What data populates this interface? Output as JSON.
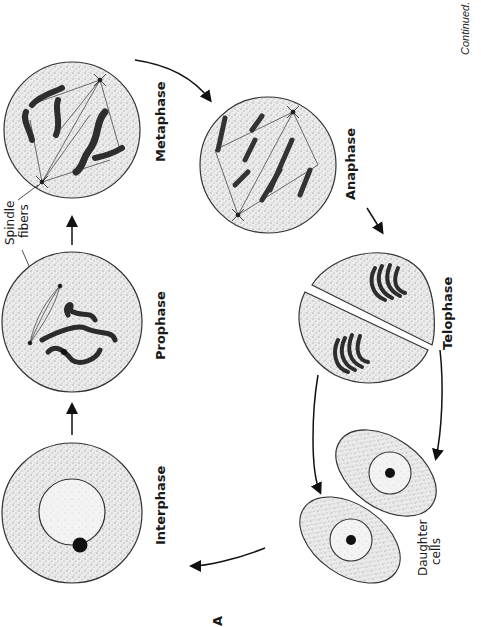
{
  "figure": {
    "panel_label": "A",
    "continued_note": "Continued.",
    "orientation": "rotated 90° counter-clockwise",
    "colors": {
      "cell_fill": "#e9e9e9",
      "outline": "#222222",
      "chromosome": "#3a3a3a",
      "stipple": "#777777"
    }
  },
  "stages": [
    {
      "id": "interphase",
      "label": "Interphase"
    },
    {
      "id": "prophase",
      "label": "Prophase"
    },
    {
      "id": "metaphase",
      "label": "Metaphase"
    },
    {
      "id": "anaphase",
      "label": "Anaphase"
    },
    {
      "id": "telophase",
      "label": "Telophase"
    },
    {
      "id": "daughter-cells",
      "label_line1": "Daughter",
      "label_line2": "cells"
    }
  ],
  "annotations": {
    "spindle_line1": "Spindle",
    "spindle_line2": "fibers"
  }
}
